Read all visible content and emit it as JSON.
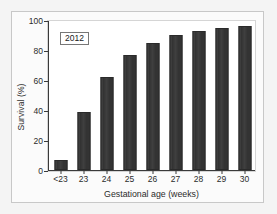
{
  "chart_data": {
    "type": "bar",
    "title": "",
    "annotation": "2012",
    "categories": [
      "<23",
      "23",
      "24",
      "25",
      "26",
      "27",
      "28",
      "29",
      "30"
    ],
    "values": [
      7,
      39,
      62,
      77,
      85,
      90,
      93,
      95,
      96
    ],
    "xlabel": "Gestational age (weeks)",
    "ylabel": "Survival (%)",
    "ylim": [
      0,
      100
    ],
    "yticks": [
      0,
      20,
      40,
      60,
      80,
      100
    ],
    "ytick_labels": [
      "0",
      "20",
      "40",
      "60",
      "80",
      "100"
    ],
    "grid": false,
    "legend": "none",
    "series": [
      {
        "name": "2012",
        "values": [
          7,
          39,
          62,
          77,
          85,
          90,
          93,
          95,
          96
        ]
      }
    ],
    "colors": {
      "bar": "#333333",
      "axis": "#3a3a3a",
      "plot_background": "#ffffff",
      "panel_background": "#fbfbfb",
      "page_background": "#f4f4f4",
      "text": "#2b2b2b"
    }
  }
}
